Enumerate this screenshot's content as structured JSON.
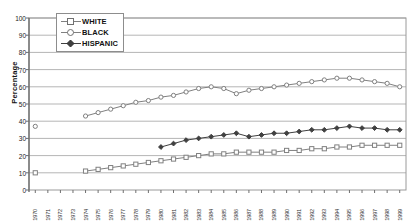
{
  "chart_data": {
    "type": "line",
    "title": "",
    "xlabel": "",
    "ylabel": "Percentage",
    "ylim": [
      0,
      100
    ],
    "ytick_step": 10,
    "yticks": [
      0,
      10,
      20,
      30,
      40,
      50,
      60,
      70,
      80,
      90,
      100
    ],
    "grid": true,
    "legend_position": "top-left-inside",
    "categories": [
      "1970",
      "1971",
      "1972",
      "1973",
      "1974",
      "1975",
      "1976",
      "1977",
      "1978",
      "1979",
      "1980",
      "1981",
      "1982",
      "1983",
      "1984",
      "1985",
      "1986",
      "1987",
      "1988",
      "1989",
      "1990",
      "1991",
      "1992",
      "1993",
      "1994",
      "1995",
      "1996",
      "1997",
      "1998",
      "1999"
    ],
    "series": [
      {
        "name": "WHITE",
        "marker": "open-square",
        "color": "#808080",
        "values": [
          10,
          null,
          null,
          null,
          11,
          12,
          13,
          14,
          15,
          16,
          17,
          18,
          19,
          20,
          21,
          21,
          22,
          22,
          22,
          22,
          23,
          23,
          24,
          24,
          25,
          25,
          26,
          26,
          26,
          26
        ]
      },
      {
        "name": "BLACK",
        "marker": "open-circle",
        "color": "#808080",
        "values": [
          37,
          null,
          null,
          null,
          43,
          45,
          47,
          49,
          51,
          52,
          54,
          55,
          57,
          59,
          60,
          59,
          56,
          58,
          59,
          60,
          61,
          62,
          63,
          64,
          65,
          65,
          64,
          63,
          62,
          60
        ]
      },
      {
        "name": "HISPANIC",
        "marker": "filled-diamond",
        "color": "#404040",
        "values": [
          null,
          null,
          null,
          null,
          null,
          null,
          null,
          null,
          null,
          null,
          25,
          27,
          29,
          30,
          31,
          32,
          33,
          31,
          32,
          33,
          33,
          34,
          35,
          35,
          36,
          37,
          36,
          36,
          35,
          35
        ]
      }
    ]
  },
  "legend": {
    "items": [
      {
        "label": "WHITE",
        "marker": "open-square"
      },
      {
        "label": "BLACK",
        "marker": "open-circle"
      },
      {
        "label": "HISPANIC",
        "marker": "filled-diamond"
      }
    ]
  },
  "colors": {
    "grid": "#b5b5b5",
    "axis": "#6f6f6f",
    "plot_border": "#9a9a9a",
    "series_light": "#808080",
    "series_dark": "#404040",
    "background": "#ffffff"
  }
}
